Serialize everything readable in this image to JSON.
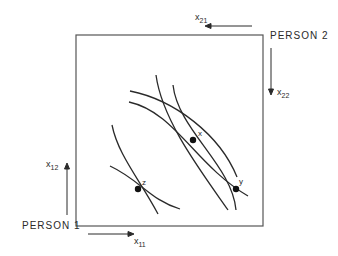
{
  "diagram": {
    "type": "edgeworth-box",
    "labels": {
      "person1": "PERSON 1",
      "person2": "PERSON 2",
      "x11_base": "x",
      "x11_sub": "11",
      "x12_base": "x",
      "x12_sub": "12",
      "x21_base": "x",
      "x21_sub": "21",
      "x22_base": "x",
      "x22_sub": "22"
    },
    "points": [
      {
        "id": "x",
        "label": "x"
      },
      {
        "id": "y",
        "label": "y"
      },
      {
        "id": "z",
        "label": "z"
      }
    ],
    "colors": {
      "line": "#2a2a2a",
      "box": "#555555",
      "background": "#ffffff"
    }
  }
}
